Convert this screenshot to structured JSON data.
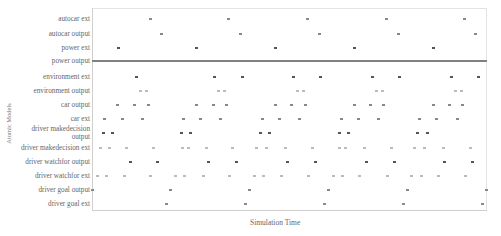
{
  "chart_data": {
    "type": "scatter",
    "title": "",
    "xlabel": "Simulation Time",
    "ylabel": "Atomic Models",
    "grid": false,
    "legend": null,
    "x_ticks": [],
    "x_range_px": [
      92,
      487
    ],
    "categories": [
      "autocar ext",
      "autocar output",
      "power ext",
      "power output",
      "environment ext",
      "environment output",
      "car output",
      "car ext",
      "driver makedecision output",
      "driver makedecision ext",
      "driver watchfor output",
      "driver watchfor ext",
      "driver goal output",
      "driver goal ext"
    ],
    "series": [
      {
        "name": "autocar ext",
        "style": "medium",
        "x": [
          150,
          228,
          307,
          386,
          464
        ]
      },
      {
        "name": "autocar output",
        "style": "medium",
        "x": [
          161,
          240,
          319,
          398,
          475
        ]
      },
      {
        "name": "power ext",
        "style": "dark",
        "x": [
          118,
          196,
          275,
          354,
          433
        ]
      },
      {
        "name": "power output",
        "style": "continuous-line",
        "x": []
      },
      {
        "name": "environment ext",
        "style": "dark",
        "x": [
          136,
          214,
          242,
          293,
          320,
          372,
          399,
          451,
          478
        ]
      },
      {
        "name": "environment output",
        "style": "faint",
        "x": [
          140,
          146,
          218,
          224,
          297,
          303,
          376,
          382,
          455,
          461
        ]
      },
      {
        "name": "car output",
        "style": "medium",
        "x": [
          117,
          134,
          148,
          196,
          213,
          226,
          275,
          291,
          305,
          354,
          370,
          383,
          433,
          449,
          462
        ]
      },
      {
        "name": "car ext",
        "style": "medium",
        "x": [
          104,
          122,
          142,
          183,
          200,
          220,
          262,
          279,
          299,
          341,
          358,
          378,
          419,
          436,
          457
        ]
      },
      {
        "name": "driver makedecision output",
        "style": "dark",
        "x": [
          103,
          112,
          181,
          190,
          260,
          269,
          339,
          348,
          417,
          427
        ]
      },
      {
        "name": "driver makedecision ext",
        "style": "faint",
        "x": [
          100,
          109,
          126,
          153,
          182,
          188,
          206,
          232,
          256,
          266,
          285,
          312,
          339,
          345,
          364,
          391,
          414,
          424,
          443,
          470
        ]
      },
      {
        "name": "driver watchfor output",
        "style": "dark",
        "x": [
          130,
          157,
          208,
          236,
          287,
          315,
          366,
          394,
          444,
          472
        ]
      },
      {
        "name": "driver watchfor ext",
        "style": "faint",
        "x": [
          97,
          106,
          124,
          150,
          175,
          184,
          203,
          229,
          254,
          263,
          281,
          308,
          333,
          342,
          359,
          387,
          411,
          421,
          438,
          465
        ]
      },
      {
        "name": "driver goal output",
        "style": "medium",
        "x": [
          92,
          170,
          249,
          328,
          407,
          486
        ]
      },
      {
        "name": "driver goal ext",
        "style": "medium",
        "x": [
          166,
          245,
          324,
          403,
          482
        ]
      }
    ]
  },
  "rows": [
    {
      "label": "autocar ext",
      "y": 19
    },
    {
      "label": "autocar output",
      "y": 34
    },
    {
      "label": "power ext",
      "y": 48
    },
    {
      "label": "power output",
      "y": 61
    },
    {
      "label": "environment ext",
      "y": 77
    },
    {
      "label": "environment output",
      "y": 91
    },
    {
      "label": "car output",
      "y": 105
    },
    {
      "label": "car ext",
      "y": 119
    },
    {
      "label": "driver makedecision\noutput",
      "y": 133
    },
    {
      "label": "driver makedecision ext",
      "y": 148
    },
    {
      "label": "driver watchfor output",
      "y": 162
    },
    {
      "label": "driver watchfor ext",
      "y": 176
    },
    {
      "label": "driver goal output",
      "y": 190
    },
    {
      "label": "driver goal ext",
      "y": 204
    }
  ],
  "labels": {
    "xlabel": "Simulation Time",
    "ylabel": "Atomic Models"
  }
}
